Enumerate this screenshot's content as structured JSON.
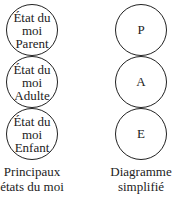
{
  "left_column": {
    "states": [
      {
        "label": "État du moi Parent",
        "lines": [
          "État du",
          "moi",
          "Parent"
        ]
      },
      {
        "label": "État du moi Adulte",
        "lines": [
          "État du",
          "moi",
          "Adulte"
        ]
      },
      {
        "label": "État du moi Enfant",
        "lines": [
          "État du",
          "moi",
          "Enfant"
        ]
      }
    ],
    "caption_lines": [
      "Principaux",
      "états du moi"
    ]
  },
  "right_column": {
    "states": [
      {
        "label": "P"
      },
      {
        "label": "A"
      },
      {
        "label": "E"
      }
    ],
    "caption_lines": [
      "Diagramme",
      "simplifié"
    ]
  }
}
